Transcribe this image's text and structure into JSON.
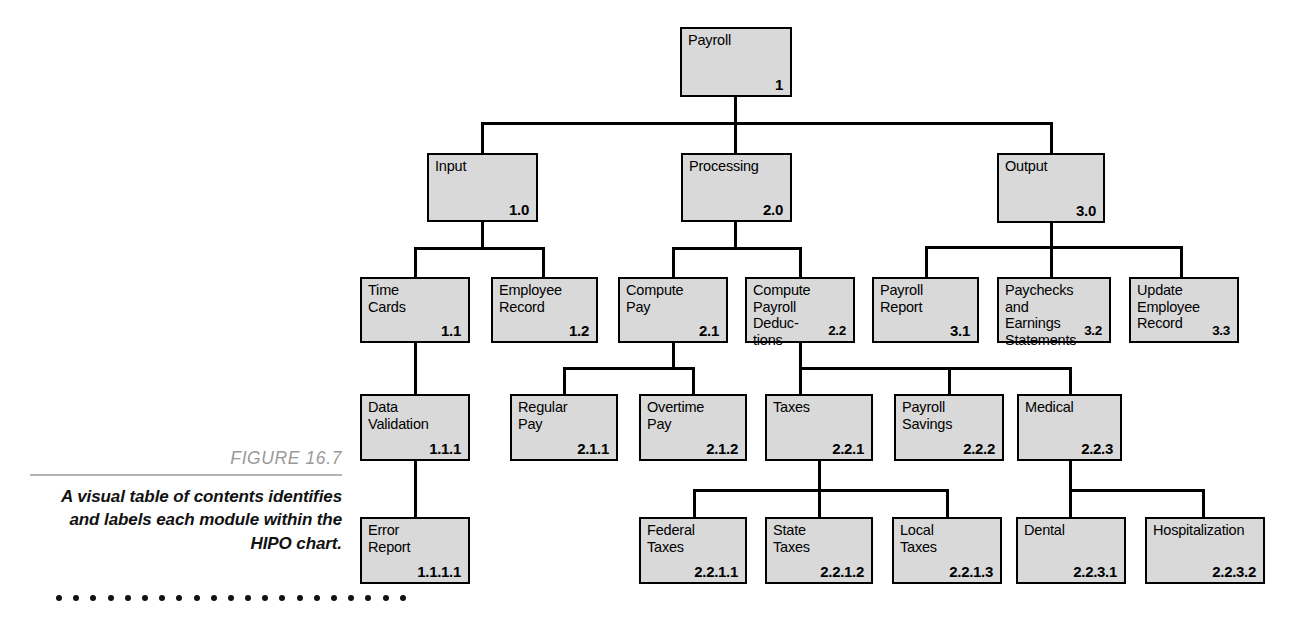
{
  "figure": {
    "number": "FIGURE 16.7",
    "caption": "A visual table of\ncontents identifies and\nlabels each module\nwithin the HIPO chart.",
    "dot_count": 21
  },
  "colors": {
    "box_fill": "#d9d9d9",
    "box_border": "#000000",
    "connector": "#000000",
    "figure_number": "#9a9a9a",
    "rule": "#b4b4b4"
  },
  "chart_data": {
    "type": "diagram",
    "nodes": [
      {
        "id": "n1",
        "label": "Payroll",
        "number": "1",
        "level": 0,
        "parent": null
      },
      {
        "id": "n1_0",
        "label": "Input",
        "number": "1.0",
        "level": 1,
        "parent": "n1"
      },
      {
        "id": "n2_0",
        "label": "Processing",
        "number": "2.0",
        "level": 1,
        "parent": "n1"
      },
      {
        "id": "n3_0",
        "label": "Output",
        "number": "3.0",
        "level": 1,
        "parent": "n1"
      },
      {
        "id": "n1_1",
        "label": "Time\nCards",
        "number": "1.1",
        "level": 2,
        "parent": "n1_0"
      },
      {
        "id": "n1_2",
        "label": "Employee\nRecord",
        "number": "1.2",
        "level": 2,
        "parent": "n1_0"
      },
      {
        "id": "n2_1",
        "label": "Compute\nPay",
        "number": "2.1",
        "level": 2,
        "parent": "n2_0"
      },
      {
        "id": "n2_2",
        "label": "Compute\nPayroll Deduc-\ntions",
        "number": "2.2",
        "level": 2,
        "parent": "n2_0"
      },
      {
        "id": "n3_1",
        "label": "Payroll\nReport",
        "number": "3.1",
        "level": 2,
        "parent": "n3_0"
      },
      {
        "id": "n3_2",
        "label": "Paychecks\nand Earnings\nStatements",
        "number": "3.2",
        "level": 2,
        "parent": "n3_0"
      },
      {
        "id": "n3_3",
        "label": "Update\nEmployee\nRecord",
        "number": "3.3",
        "level": 2,
        "parent": "n3_0"
      },
      {
        "id": "n1_1_1",
        "label": "Data\nValidation",
        "number": "1.1.1",
        "level": 3,
        "parent": "n1_1"
      },
      {
        "id": "n2_1_1",
        "label": "Regular\nPay",
        "number": "2.1.1",
        "level": 3,
        "parent": "n2_1"
      },
      {
        "id": "n2_1_2",
        "label": "Overtime\nPay",
        "number": "2.1.2",
        "level": 3,
        "parent": "n2_1"
      },
      {
        "id": "n2_2_1",
        "label": "Taxes",
        "number": "2.2.1",
        "level": 3,
        "parent": "n2_2"
      },
      {
        "id": "n2_2_2",
        "label": "Payroll\nSavings",
        "number": "2.2.2",
        "level": 3,
        "parent": "n2_2"
      },
      {
        "id": "n2_2_3",
        "label": "Medical",
        "number": "2.2.3",
        "level": 3,
        "parent": "n2_2"
      },
      {
        "id": "n1_1_1_1",
        "label": "Error\nReport",
        "number": "1.1.1.1",
        "level": 4,
        "parent": "n1_1_1"
      },
      {
        "id": "n2_2_1_1",
        "label": "Federal\nTaxes",
        "number": "2.2.1.1",
        "level": 4,
        "parent": "n2_2_1"
      },
      {
        "id": "n2_2_1_2",
        "label": "State\nTaxes",
        "number": "2.2.1.2",
        "level": 4,
        "parent": "n2_2_1"
      },
      {
        "id": "n2_2_1_3",
        "label": "Local\nTaxes",
        "number": "2.2.1.3",
        "level": 4,
        "parent": "n2_2_1"
      },
      {
        "id": "n2_2_3_1",
        "label": "Dental",
        "number": "2.2.3.1",
        "level": 4,
        "parent": "n2_2_3"
      },
      {
        "id": "n2_2_3_2",
        "label": "Hospitalization",
        "number": "2.2.3.2",
        "level": 4,
        "parent": "n2_2_3"
      }
    ]
  }
}
